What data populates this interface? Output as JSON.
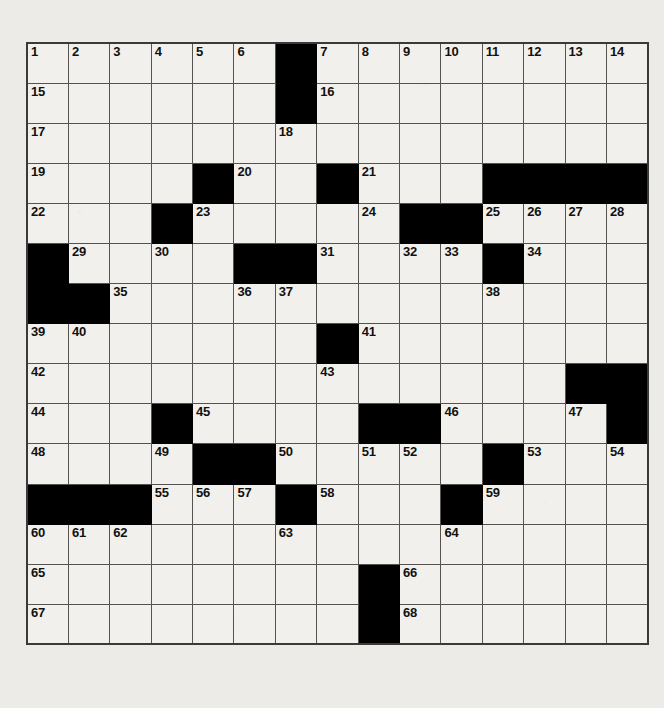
{
  "puzzle": {
    "kind": "crossword-grid",
    "rows": 16,
    "columns": 15,
    "cell_background": "#f2f0ec",
    "block_color": "#000000",
    "grid_line_color": "#55534f",
    "page_background": "#edebe7",
    "number_color": "#111111",
    "highest_clue_number": 68,
    "grid": [
      [
        {
          "num": "1"
        },
        {
          "num": "2"
        },
        {
          "num": "3"
        },
        {
          "num": "4"
        },
        {
          "num": "5"
        },
        {
          "num": "6"
        },
        {
          "block": true
        },
        {
          "num": "7"
        },
        {
          "num": "8"
        },
        {
          "num": "9"
        },
        {
          "num": "10"
        },
        {
          "num": "11"
        },
        {
          "num": "12"
        },
        {
          "num": "13"
        },
        {
          "num": "14"
        }
      ],
      [
        {
          "num": "15"
        },
        {},
        {},
        {},
        {},
        {},
        {
          "block": true
        },
        {
          "num": "16"
        },
        {},
        {},
        {},
        {},
        {},
        {},
        {}
      ],
      [
        {
          "num": "17"
        },
        {},
        {},
        {},
        {},
        {},
        {
          "num": "18"
        },
        {},
        {},
        {},
        {},
        {},
        {},
        {},
        {}
      ],
      [
        {
          "num": "19"
        },
        {},
        {},
        {},
        {
          "block": true
        },
        {
          "num": "20"
        },
        {},
        {
          "block": true
        },
        {
          "num": "21"
        },
        {},
        {},
        {
          "block": true
        },
        {
          "block": true
        },
        {
          "block": true
        },
        {
          "block": true
        }
      ],
      [
        {
          "num": "22"
        },
        {},
        {},
        {
          "block": true
        },
        {
          "num": "23"
        },
        {},
        {},
        {},
        {
          "num": "24"
        },
        {
          "block": true
        },
        {
          "block": true
        },
        {
          "num": "25"
        },
        {
          "num": "26"
        },
        {
          "num": "27"
        },
        {
          "num": "28"
        }
      ],
      [
        {
          "block": true
        },
        {
          "num": "29"
        },
        {},
        {
          "num": "30"
        },
        {},
        {
          "block": true
        },
        {
          "block": true
        },
        {
          "num": "31"
        },
        {},
        {
          "num": "32"
        },
        {
          "num": "33"
        },
        {
          "block": true
        },
        {
          "num": "34"
        },
        {},
        {}
      ],
      [
        {
          "block": true
        },
        {
          "block": true
        },
        {
          "num": "35"
        },
        {},
        {},
        {
          "num": "36"
        },
        {
          "num": "37"
        },
        {},
        {},
        {},
        {},
        {
          "num": "38"
        },
        {},
        {},
        {}
      ],
      [
        {
          "num": "39"
        },
        {
          "num": "40"
        },
        {},
        {},
        {},
        {},
        {},
        {
          "block": true
        },
        {
          "num": "41"
        },
        {},
        {},
        {},
        {},
        {},
        {}
      ],
      [
        {
          "num": "42"
        },
        {},
        {},
        {},
        {},
        {},
        {},
        {
          "num": "43"
        },
        {},
        {},
        {},
        {},
        {},
        {
          "block": true
        },
        {
          "block": true
        }
      ],
      [
        {
          "num": "44"
        },
        {},
        {},
        {
          "block": true
        },
        {
          "num": "45"
        },
        {},
        {},
        {},
        {
          "block": true
        },
        {
          "block": true
        },
        {
          "num": "46"
        },
        {},
        {},
        {
          "num": "47"
        },
        {
          "block": true
        }
      ],
      [
        {
          "num": "48"
        },
        {},
        {},
        {
          "num": "49"
        },
        {
          "block": true
        },
        {
          "block": true
        },
        {
          "num": "50"
        },
        {},
        {
          "num": "51"
        },
        {
          "num": "52"
        },
        {},
        {
          "block": true
        },
        {
          "num": "53"
        },
        {},
        {
          "num": "54"
        }
      ],
      [
        {
          "block": true
        },
        {
          "block": true
        },
        {
          "block": true
        },
        {
          "num": "55"
        },
        {
          "num": "56"
        },
        {
          "num": "57"
        },
        {
          "block": true
        },
        {
          "num": "58"
        },
        {},
        {},
        {
          "block": true
        },
        {
          "num": "59"
        },
        {},
        {},
        {}
      ],
      [
        {
          "num": "60"
        },
        {
          "num": "61"
        },
        {
          "num": "62"
        },
        {},
        {},
        {},
        {
          "num": "63"
        },
        {},
        {},
        {},
        {
          "num": "64"
        },
        {},
        {},
        {},
        {}
      ],
      [
        {
          "num": "65"
        },
        {},
        {},
        {},
        {},
        {},
        {},
        {},
        {
          "block": true
        },
        {
          "num": "66"
        },
        {},
        {},
        {},
        {},
        {}
      ],
      [
        {
          "num": "67"
        },
        {},
        {},
        {},
        {},
        {},
        {},
        {},
        {
          "block": true
        },
        {
          "num": "68"
        },
        {},
        {},
        {},
        {},
        {}
      ]
    ]
  }
}
